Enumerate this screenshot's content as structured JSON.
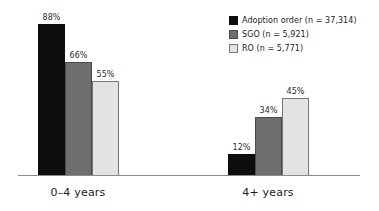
{
  "chart_data": {
    "type": "bar",
    "title": "",
    "subtitle": "",
    "xlabel": "",
    "ylabel": "",
    "ylim": [
      0,
      100
    ],
    "grid": false,
    "legend_position": "top-right",
    "categories": [
      "0–4 years",
      "4+ years"
    ],
    "series": [
      {
        "name": "Adoption order (n = 37,314)",
        "short_name": "Adoption order",
        "n": "37,314",
        "color": "#0d0d0d",
        "values": [
          88,
          12
        ],
        "value_labels": [
          "88%",
          "12%"
        ]
      },
      {
        "name": "SGO (n = 5,921)",
        "short_name": "SGO",
        "n": "5,921",
        "color": "#6e6e6e",
        "values": [
          66,
          34
        ],
        "value_labels": [
          "66%",
          "34%"
        ]
      },
      {
        "name": "RO (n = 5,771)",
        "short_name": "RO",
        "n": "5,771",
        "color": "#e3e3e3",
        "values": [
          55,
          45
        ],
        "value_labels": [
          "55%",
          "45%"
        ]
      }
    ]
  },
  "legend": {
    "items": [
      {
        "label": "Adoption order (n = 37,314)"
      },
      {
        "label": "SGO (n = 5,921)"
      },
      {
        "label": "RO (n = 5,771)"
      }
    ]
  },
  "axis": {
    "group_labels": [
      "0–4 years",
      "4+ years"
    ]
  },
  "colors": {
    "adoption": "#0d0d0d",
    "sgo": "#6e6e6e",
    "ro": "#e3e3e3",
    "axis": "#8a8a8a",
    "text": "#1c1c1c",
    "background": "#ffffff"
  }
}
